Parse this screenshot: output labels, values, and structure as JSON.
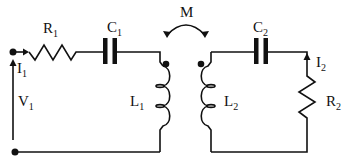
{
  "diagram": {
    "type": "circuit",
    "colors": {
      "line": "#111111",
      "background": "#ffffff"
    },
    "mutual_inductance": {
      "label": "M",
      "sub": ""
    },
    "primary": {
      "source": {
        "label": "V",
        "sub": "1"
      },
      "current": {
        "label": "I",
        "sub": "1"
      },
      "resistor": {
        "label": "R",
        "sub": "1"
      },
      "capacitor": {
        "label": "C",
        "sub": "1"
      },
      "inductor": {
        "label": "L",
        "sub": "1"
      }
    },
    "secondary": {
      "capacitor": {
        "label": "C",
        "sub": "2"
      },
      "current": {
        "label": "I",
        "sub": "2"
      },
      "resistor": {
        "label": "R",
        "sub": "2"
      },
      "inductor": {
        "label": "L",
        "sub": "2"
      }
    }
  }
}
